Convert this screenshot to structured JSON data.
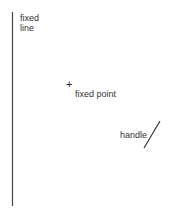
{
  "diagram": {
    "fixed_line": {
      "label_line1": "fixed",
      "label_line2": "line"
    },
    "fixed_point": {
      "marker": "+",
      "label": "fixed point"
    },
    "handle": {
      "label": "handle"
    }
  }
}
